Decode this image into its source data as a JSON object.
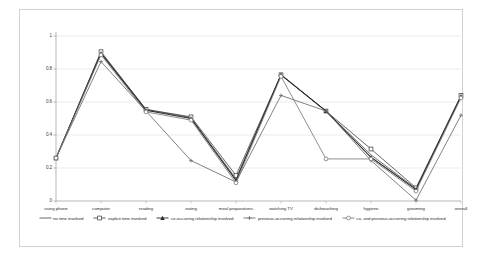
{
  "chart_data": {
    "type": "line",
    "title": "",
    "xlabel": "",
    "ylabel": "",
    "ylim": [
      0,
      1
    ],
    "yticks": [
      "0",
      "0.2",
      "0.4",
      "0.6",
      "0.8",
      "1"
    ],
    "grid": true,
    "legend_position": "bottom",
    "categories": [
      "using phone",
      "computer",
      "reading",
      "eating",
      "meal preparations",
      "watching TV",
      "dishwashing",
      "hygiene",
      "grooming",
      "overall"
    ],
    "series": [
      {
        "name": "no time involved",
        "marker": "none",
        "color": "#5a5a5a",
        "values": [
          0.26,
          0.9,
          0.555,
          0.505,
          0.135,
          0.765,
          0.545,
          0.28,
          0.075,
          0.635
        ]
      },
      {
        "name": "explicit time involved",
        "marker": "square",
        "color": "#4d4d4d",
        "values": [
          0.26,
          0.905,
          0.555,
          0.51,
          0.155,
          0.765,
          0.545,
          0.315,
          0.08,
          0.64
        ]
      },
      {
        "name": "co-occurring relationship involved",
        "marker": "triangle",
        "color": "#2b2b2b",
        "values": [
          0.26,
          0.895,
          0.55,
          0.5,
          0.125,
          0.765,
          0.545,
          0.265,
          0.07,
          0.635
        ]
      },
      {
        "name": "previous-occurring relationship involved",
        "marker": "cross",
        "color": "#6b6b6b",
        "values": [
          0.26,
          0.845,
          0.545,
          0.245,
          0.115,
          0.64,
          0.545,
          0.245,
          0.005,
          0.52
        ]
      },
      {
        "name": "co- and previous-occurring relationship involved",
        "marker": "circle",
        "color": "#7a7a7a",
        "values": [
          0.26,
          0.885,
          0.54,
          0.49,
          0.11,
          0.755,
          0.255,
          0.255,
          0.06,
          0.625
        ]
      }
    ]
  }
}
